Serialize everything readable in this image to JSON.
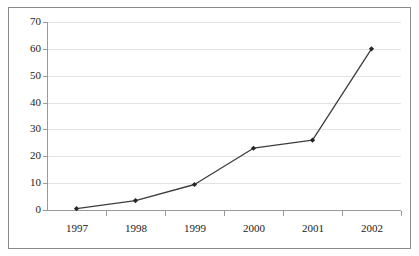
{
  "chart_data": {
    "type": "line",
    "title": "",
    "subtitle": "",
    "xlabel": "",
    "ylabel": "",
    "categories": [
      "1997",
      "1998",
      "1999",
      "2000",
      "2001",
      "2002"
    ],
    "values": [
      0.5,
      3.5,
      9.5,
      23,
      26,
      60
    ],
    "series": [
      {
        "name": "",
        "values": [
          0.5,
          3.5,
          9.5,
          23,
          26,
          60
        ]
      }
    ],
    "ylim": [
      0,
      70
    ],
    "ytick_values": [
      0,
      10,
      20,
      30,
      40,
      50,
      60,
      70
    ],
    "ytick_labels": [
      "0",
      "10",
      "20",
      "30",
      "40",
      "50",
      "60",
      "70"
    ],
    "xtick_labels": [
      "1997",
      "1998",
      "1999",
      "2000",
      "2001",
      "2002"
    ],
    "grid": "horizontal",
    "legend": "none",
    "marker": "diamond",
    "line_color": "#3d3d3d",
    "marker_color": "#262626",
    "grid_color": "#e3e3e3",
    "axis_color": "#9a9a9a",
    "frame_color": "#8a8a8a",
    "background_color": "#ffffff"
  }
}
